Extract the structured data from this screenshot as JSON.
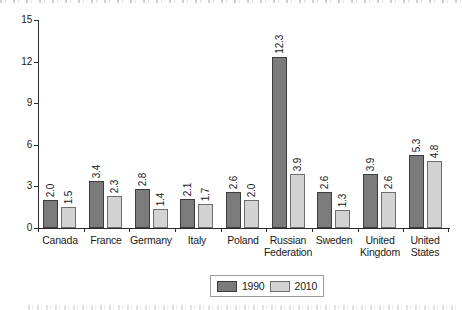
{
  "chart_data": {
    "type": "bar",
    "categories": [
      "Canada",
      "France",
      "Germany",
      "Italy",
      "Poland",
      "Russian Federation",
      "Sweden",
      "United Kingdom",
      "United States"
    ],
    "series": [
      {
        "name": "1990",
        "values": [
          2.0,
          3.4,
          2.8,
          2.1,
          2.6,
          12.3,
          2.6,
          3.9,
          5.3
        ],
        "fill": "#7b7b7b",
        "edge": "#3c3c3c"
      },
      {
        "name": "2010",
        "values": [
          1.5,
          2.3,
          1.4,
          1.7,
          2.0,
          3.9,
          1.3,
          2.6,
          4.8
        ],
        "fill": "#d3d3d3",
        "edge": "#6e6e6e"
      }
    ],
    "value_labels": {
      "1990": [
        "2.0",
        "3.4",
        "2.8",
        "2.1",
        "2.6",
        "12.3",
        "2.6",
        "3.9",
        "5.3"
      ],
      "2010": [
        "1.5",
        "2.3",
        "1.4",
        "1.7",
        "2.0",
        "3.9",
        "1.3",
        "2.6",
        "4.8"
      ]
    },
    "title": "",
    "xlabel": "",
    "ylabel": "",
    "ylim": [
      0,
      15
    ],
    "y_ticks": [
      "0",
      "3",
      "6",
      "9",
      "12",
      "15"
    ],
    "grid": "off",
    "legend_position": "bottom-center"
  },
  "legend": {
    "items": [
      {
        "label": "1990"
      },
      {
        "label": "2010"
      }
    ]
  },
  "colors": {
    "axis": "#2a2a2a",
    "text": "#1a1a1a",
    "legend_border": "#9b9b9b",
    "bar_1990_fill": "#7b7b7b",
    "bar_1990_edge": "#3c3c3c",
    "bar_2010_fill": "#d3d3d3",
    "bar_2010_edge": "#6e6e6e"
  }
}
